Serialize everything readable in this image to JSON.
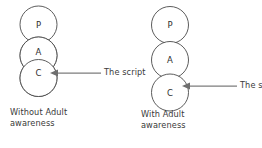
{
  "figure": {
    "background_color": "#ffffff",
    "stroke_color": "#4a4a4a",
    "arrow_color": "#7d7d7d",
    "text_color": "#3a3a3a",
    "overlap_fill_color": "#e6e4e2"
  },
  "panels": [
    {
      "id": "without-adult-awareness",
      "circles": [
        {
          "letter": "P",
          "cx": 38.5,
          "cy": 24.5,
          "r": 18.5
        },
        {
          "letter": "A",
          "cx": 38.5,
          "cy": 55.5,
          "r": 18.5
        },
        {
          "letter": "C",
          "cx": 38.5,
          "cy": 78.0,
          "r": 18.5
        }
      ],
      "overlap": {
        "present": true,
        "between": [
          "A",
          "C"
        ],
        "fill": "#e6e4e2"
      },
      "annotation": {
        "label": "The script",
        "arrow_from_x": 101,
        "arrow_to_x": 53,
        "arrow_y": 73,
        "label_x": 104,
        "label_y": 68
      },
      "caption": {
        "line1": "Without Adult",
        "line2": "awareness",
        "x": 10,
        "y": 108
      }
    },
    {
      "id": "with-adult-awareness",
      "circles": [
        {
          "letter": "P",
          "cx": 170.0,
          "cy": 25.0,
          "r": 18.5
        },
        {
          "letter": "A",
          "cx": 170.0,
          "cy": 60.0,
          "r": 18.5
        },
        {
          "letter": "C",
          "cx": 170.0,
          "cy": 92.5,
          "r": 18.5
        }
      ],
      "overlap": {
        "present": false,
        "between": [],
        "fill": "#e6e4e2"
      },
      "annotation": {
        "label": "The script",
        "arrow_from_x": 237,
        "arrow_to_x": 185,
        "arrow_y": 86,
        "label_x": 240,
        "label_y": 81
      },
      "caption": {
        "line1": "With Adult",
        "line2": "awareness",
        "x": 141,
        "y": 110
      }
    }
  ]
}
